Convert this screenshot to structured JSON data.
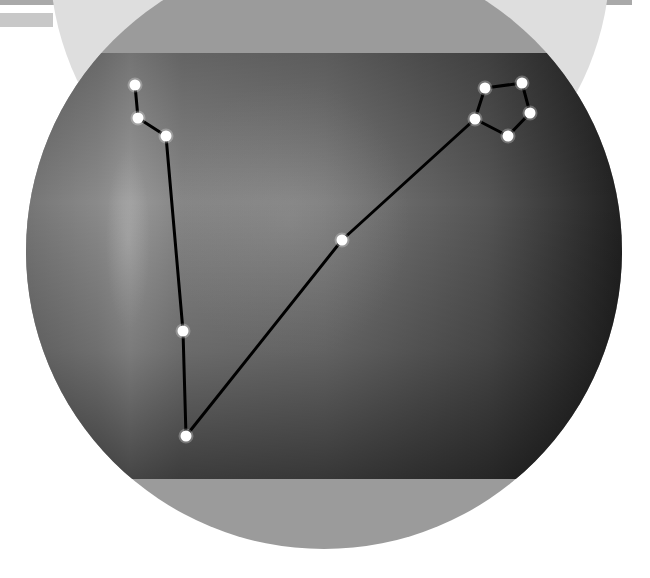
{
  "figure": {
    "kind": "constellation-diagram",
    "colors": {
      "background": "#ffffff",
      "top_bar": "#a9a9a9",
      "top_tab": "#c8c8c8",
      "ghost_circle": "#dcdcdc",
      "disc_band": "#9a9a9a",
      "photo_light": "#8c8c8c",
      "photo_mid": "#5e5e5e",
      "photo_dark": "#1e1e1e",
      "star": "#ffffff",
      "line": "#000000"
    },
    "disc": {
      "cx": 324,
      "cy": 251,
      "r": 298
    },
    "photo_band": {
      "top": 53,
      "bottom": 479
    },
    "stars": [
      {
        "id": "s1",
        "x": 135,
        "y": 85
      },
      {
        "id": "s2",
        "x": 138,
        "y": 118
      },
      {
        "id": "s3",
        "x": 166,
        "y": 136
      },
      {
        "id": "s4",
        "x": 183,
        "y": 331
      },
      {
        "id": "s5",
        "x": 186,
        "y": 436
      },
      {
        "id": "s6",
        "x": 342,
        "y": 240
      },
      {
        "id": "s7",
        "x": 475,
        "y": 119
      },
      {
        "id": "s8",
        "x": 485,
        "y": 88
      },
      {
        "id": "s9",
        "x": 522,
        "y": 83
      },
      {
        "id": "s10",
        "x": 530,
        "y": 113
      },
      {
        "id": "s11",
        "x": 508,
        "y": 136
      }
    ],
    "edges": [
      [
        "s1",
        "s2"
      ],
      [
        "s2",
        "s3"
      ],
      [
        "s3",
        "s4"
      ],
      [
        "s4",
        "s5"
      ],
      [
        "s5",
        "s6"
      ],
      [
        "s6",
        "s7"
      ],
      [
        "s7",
        "s8"
      ],
      [
        "s8",
        "s9"
      ],
      [
        "s9",
        "s10"
      ],
      [
        "s10",
        "s11"
      ],
      [
        "s11",
        "s7"
      ]
    ]
  }
}
